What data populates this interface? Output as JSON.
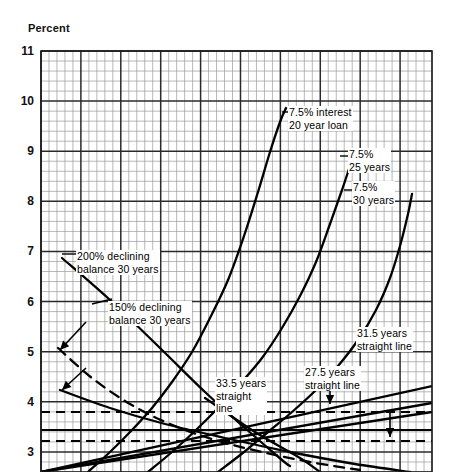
{
  "figure": {
    "axis_label": "Percent",
    "background": "#ffffff",
    "grid_color_minor": "#9a9a9a",
    "grid_color_major": "#2a2a2a",
    "curve_color": "#000000"
  },
  "chart_data": {
    "type": "line",
    "title": "",
    "subtitle": "",
    "xlabel": "",
    "ylabel": "Percent",
    "ylim": [
      2.6,
      11
    ],
    "xlim": [
      0,
      49
    ],
    "yticks": [
      11,
      10,
      9,
      8,
      7,
      6,
      5,
      4,
      3
    ],
    "ytick_labels": [
      "11",
      "10",
      "9",
      "8",
      "7",
      "6",
      "5",
      "4",
      "3"
    ],
    "grid": true,
    "grid_minor_x_step": 1,
    "grid_major_x_step": 5,
    "grid_minor_y_step": 0.2,
    "grid_major_y_step": 1,
    "legend_position": "inline-annotations",
    "annotations": [
      {
        "id": "ann-20-year",
        "text": "7.5% interest\n20 year loan",
        "x_px": 288,
        "y_px": 106,
        "curve": "7.5% interest 20 year loan"
      },
      {
        "id": "ann-25-year",
        "text": "7.5%\n25 years",
        "x_px": 348,
        "y_px": 148,
        "curve": "7.5% 25 years"
      },
      {
        "id": "ann-30-year",
        "text": "7.5%\n30 years",
        "x_px": 352,
        "y_px": 181,
        "curve": "7.5% 30 years"
      },
      {
        "id": "ann-200-declining",
        "text": "200% declining\nbalance 30 years",
        "x_px": 76,
        "y_px": 250,
        "curve": "200% declining balance 30 years"
      },
      {
        "id": "ann-150-declining",
        "text": "150% declining\nbalance 30 years",
        "x_px": 108,
        "y_px": 301,
        "curve": "150% declining balance 30 years"
      },
      {
        "id": "ann-31-5",
        "text": "31.5 years\nstraight line",
        "x_px": 356,
        "y_px": 327,
        "curve": "31.5 years straight line"
      },
      {
        "id": "ann-27-5",
        "text": "27.5 years\nstraight line",
        "x_px": 304,
        "y_px": 366,
        "curve": "27.5 years straight line"
      },
      {
        "id": "ann-33-5",
        "text": "33.5 years\nstraight\nline",
        "x_px": 215,
        "y_px": 377,
        "curve": "33.5 years straight line"
      }
    ],
    "reference_lines": [
      {
        "id": "ref-upper-dashed",
        "style": "dashed",
        "y_px": 412,
        "y_value": 3.74
      },
      {
        "id": "ref-solid",
        "style": "solid",
        "y_px": 430,
        "y_value": 3.36
      },
      {
        "id": "ref-lower-dashed",
        "style": "dashed",
        "y_px": 441,
        "y_value": 3.13
      }
    ],
    "series": [
      {
        "name": "7.5% interest 20 year loan",
        "style": "solid",
        "points_px": [
          [
            88,
            472
          ],
          [
            110,
            452
          ],
          [
            132,
            430
          ],
          [
            152,
            408
          ],
          [
            172,
            382
          ],
          [
            192,
            352
          ],
          [
            210,
            318
          ],
          [
            228,
            280
          ],
          [
            244,
            236
          ],
          [
            258,
            192
          ],
          [
            270,
            152
          ],
          [
            280,
            122
          ],
          [
            286,
            108
          ]
        ]
      },
      {
        "name": "7.5% 25 years",
        "style": "solid",
        "points_px": [
          [
            148,
            472
          ],
          [
            172,
            452
          ],
          [
            196,
            430
          ],
          [
            218,
            408
          ],
          [
            240,
            384
          ],
          [
            262,
            358
          ],
          [
            282,
            328
          ],
          [
            300,
            296
          ],
          [
            316,
            262
          ],
          [
            330,
            224
          ],
          [
            342,
            190
          ],
          [
            350,
            166
          ],
          [
            355,
            152
          ]
        ]
      },
      {
        "name": "7.5% 30 years",
        "style": "solid",
        "points_px": [
          [
            218,
            472
          ],
          [
            244,
            452
          ],
          [
            268,
            432
          ],
          [
            292,
            412
          ],
          [
            316,
            390
          ],
          [
            338,
            366
          ],
          [
            358,
            340
          ],
          [
            376,
            310
          ],
          [
            390,
            278
          ],
          [
            400,
            246
          ],
          [
            408,
            214
          ],
          [
            412,
            194
          ]
        ]
      },
      {
        "name": "31.5 years straight line",
        "style": "solid",
        "points_px": [
          [
            41,
            472
          ],
          [
            432,
            403
          ]
        ]
      },
      {
        "name": "27.5 years straight line",
        "style": "solid",
        "points_px": [
          [
            41,
            472
          ],
          [
            432,
            386
          ]
        ]
      },
      {
        "name": "33.5 years straight line",
        "style": "solid",
        "points_px": [
          [
            41,
            472
          ],
          [
            432,
            412
          ]
        ]
      },
      {
        "name": "200% declining balance 30 years",
        "style": "dashed",
        "points_px": [
          [
            58,
            348
          ],
          [
            92,
            378
          ],
          [
            130,
            404
          ],
          [
            170,
            424
          ],
          [
            215,
            440
          ],
          [
            262,
            452
          ],
          [
            310,
            462
          ],
          [
            360,
            470
          ]
        ]
      },
      {
        "name": "150% declining balance 30 years",
        "style": "solid",
        "points_px": [
          [
            60,
            390
          ],
          [
            110,
            408
          ],
          [
            165,
            424
          ],
          [
            225,
            438
          ],
          [
            290,
            452
          ],
          [
            355,
            464
          ],
          [
            410,
            472
          ]
        ]
      },
      {
        "name": "declining-steep-upper",
        "style": "solid",
        "points_px": [
          [
            62,
            258
          ],
          [
            110,
            300
          ],
          [
            160,
            348
          ],
          [
            205,
            392
          ],
          [
            245,
            428
          ],
          [
            282,
            460
          ],
          [
            290,
            466
          ]
        ]
      },
      {
        "name": "declining-secondary",
        "style": "solid",
        "points_px": [
          [
            205,
            398
          ],
          [
            255,
            432
          ],
          [
            300,
            458
          ],
          [
            320,
            472
          ]
        ]
      }
    ]
  }
}
